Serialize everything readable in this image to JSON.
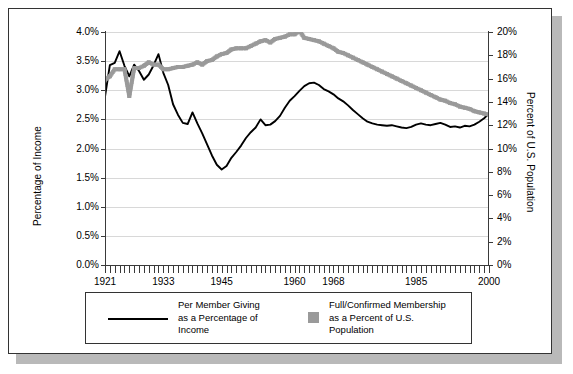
{
  "figure": {
    "background": "#ffffff",
    "frame_color": "#333333",
    "shadow_color": "#b9b9b9"
  },
  "chart_data": {
    "type": "line",
    "title": "",
    "xlabel": "",
    "ylabel": "Percentage of Income",
    "y2label": "Percent of U.S. Population",
    "grid": true,
    "legend_position": "bottom",
    "xlim": [
      1921,
      2000
    ],
    "ylim": [
      0.0,
      4.0
    ],
    "y2lim": [
      0,
      20
    ],
    "x_tick_labels": [
      "1921",
      "1933",
      "1945",
      "1960",
      "1968",
      "1985",
      "2000"
    ],
    "x_tick_values": [
      1921,
      1933,
      1945,
      1960,
      1968,
      1985,
      2000
    ],
    "y_tick_labels": [
      "0.0%",
      "0.5%",
      "1.0%",
      "1.5%",
      "2.0%",
      "2.5%",
      "3.0%",
      "3.5%",
      "4.0%"
    ],
    "y_tick_values": [
      0.0,
      0.5,
      1.0,
      1.5,
      2.0,
      2.5,
      3.0,
      3.5,
      4.0
    ],
    "y2_tick_labels": [
      "0%",
      "2%",
      "4%",
      "6%",
      "8%",
      "10%",
      "12%",
      "14%",
      "16%",
      "18%",
      "20%"
    ],
    "y2_tick_values": [
      0,
      2,
      4,
      6,
      8,
      10,
      12,
      14,
      16,
      18,
      20
    ],
    "series": [
      {
        "name": "Per Member Giving as a Percentage of Income",
        "axis": "left",
        "style": "line",
        "color": "#000000",
        "x": [
          1921,
          1922,
          1923,
          1924,
          1925,
          1926,
          1927,
          1928,
          1929,
          1930,
          1931,
          1932,
          1933,
          1934,
          1935,
          1936,
          1937,
          1938,
          1939,
          1940,
          1941,
          1942,
          1943,
          1944,
          1945,
          1946,
          1947,
          1948,
          1949,
          1950,
          1951,
          1952,
          1953,
          1954,
          1955,
          1956,
          1957,
          1958,
          1959,
          1960,
          1961,
          1962,
          1963,
          1964,
          1965,
          1966,
          1967,
          1968,
          1969,
          1970,
          1971,
          1972,
          1973,
          1974,
          1975,
          1976,
          1977,
          1978,
          1979,
          1980,
          1981,
          1982,
          1983,
          1984,
          1985,
          1986,
          1987,
          1988,
          1989,
          1990,
          1991,
          1992,
          1993,
          1994,
          1995,
          1996,
          1997,
          1998,
          1999,
          2000
        ],
        "values": [
          2.89,
          3.43,
          3.47,
          3.67,
          3.42,
          3.24,
          3.44,
          3.33,
          3.18,
          3.27,
          3.43,
          3.62,
          3.3,
          3.09,
          2.76,
          2.58,
          2.44,
          2.42,
          2.62,
          2.43,
          2.26,
          2.07,
          1.88,
          1.72,
          1.64,
          1.7,
          1.84,
          1.94,
          2.05,
          2.18,
          2.28,
          2.36,
          2.5,
          2.4,
          2.41,
          2.47,
          2.56,
          2.7,
          2.82,
          2.9,
          2.99,
          3.07,
          3.12,
          3.13,
          3.09,
          3.02,
          2.98,
          2.93,
          2.86,
          2.81,
          2.74,
          2.66,
          2.59,
          2.52,
          2.46,
          2.43,
          2.41,
          2.4,
          2.39,
          2.4,
          2.38,
          2.36,
          2.35,
          2.37,
          2.41,
          2.43,
          2.41,
          2.4,
          2.42,
          2.44,
          2.41,
          2.37,
          2.38,
          2.36,
          2.39,
          2.38,
          2.41,
          2.46,
          2.52,
          2.6
        ]
      },
      {
        "name": "Full/Confirmed Membership as a Percent of U.S. Population",
        "axis": "right",
        "style": "thick-dotted",
        "color": "#9a9a9a",
        "x": [
          1921,
          1922,
          1923,
          1924,
          1925,
          1926,
          1927,
          1928,
          1929,
          1930,
          1931,
          1932,
          1933,
          1934,
          1935,
          1936,
          1937,
          1938,
          1939,
          1940,
          1941,
          1942,
          1943,
          1944,
          1945,
          1946,
          1947,
          1948,
          1949,
          1950,
          1951,
          1952,
          1953,
          1954,
          1955,
          1956,
          1957,
          1958,
          1959,
          1960,
          1961,
          1962,
          1963,
          1964,
          1965,
          1966,
          1967,
          1968,
          1969,
          1970,
          1971,
          1972,
          1973,
          1974,
          1975,
          1976,
          1977,
          1978,
          1979,
          1980,
          1981,
          1982,
          1983,
          1984,
          1985,
          1986,
          1987,
          1988,
          1989,
          1990,
          1991,
          1992,
          1993,
          1994,
          1995,
          1996,
          1997,
          1998,
          1999,
          2000
        ],
        "values": [
          15.9,
          16.2,
          16.8,
          16.8,
          16.8,
          14.5,
          16.9,
          16.9,
          17.1,
          17.4,
          17.2,
          17.2,
          16.8,
          16.8,
          16.9,
          17.0,
          17.0,
          17.1,
          17.2,
          17.4,
          17.2,
          17.5,
          17.6,
          17.9,
          18.1,
          18.2,
          18.5,
          18.6,
          18.6,
          18.6,
          18.8,
          19.0,
          19.2,
          19.3,
          19.1,
          19.4,
          19.5,
          19.6,
          19.8,
          19.8,
          20.1,
          19.5,
          19.4,
          19.3,
          19.2,
          19.0,
          18.8,
          18.6,
          18.3,
          18.2,
          18.0,
          17.8,
          17.6,
          17.4,
          17.2,
          17.0,
          16.8,
          16.6,
          16.4,
          16.2,
          16.0,
          15.8,
          15.6,
          15.4,
          15.2,
          15.0,
          14.8,
          14.6,
          14.4,
          14.2,
          14.1,
          13.9,
          13.8,
          13.6,
          13.5,
          13.4,
          13.2,
          13.1,
          13.0,
          12.9
        ]
      }
    ],
    "legend_entries": [
      {
        "key": "line",
        "line1": "Per Member Giving",
        "line2": "as a Percentage of",
        "line3": "Income"
      },
      {
        "key": "square",
        "line1": "Full/Confirmed Membership",
        "line2": "as a Percent of U.S.",
        "line3": "Population"
      }
    ]
  }
}
